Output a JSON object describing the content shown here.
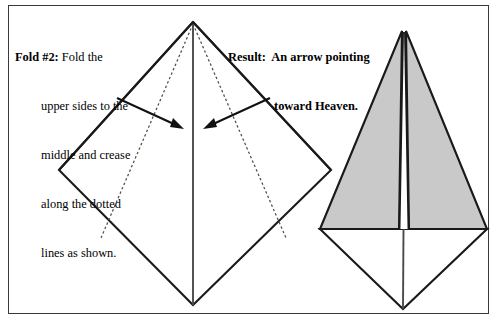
{
  "page": {
    "width": 497,
    "height": 321,
    "background": "#ffffff",
    "frame_color": "#3a3a3a"
  },
  "instruction": {
    "label": "Fold #2:",
    "line1": " Fold the",
    "line2": "upper sides to the",
    "line3": "middle and crease",
    "line4": "along the dotted",
    "line5": "lines as shown."
  },
  "result": {
    "label": "Result:",
    "line1": "  An arrow pointing",
    "line2": "toward Heaven."
  },
  "figures": {
    "left": {
      "name": "unfolded-square-diamond",
      "top": [
        193,
        22
      ],
      "left": [
        59,
        170
      ],
      "right": [
        331,
        170
      ],
      "bottom": [
        193,
        305
      ],
      "center_line_color": "#4a4a4a",
      "outline_color": "#1a1a1a",
      "crease_style": "dotted",
      "crease_color": "#555555"
    },
    "right": {
      "name": "folded-arrow-kite",
      "apex": [
        404,
        31
      ],
      "left_corner": [
        320,
        229
      ],
      "right_corner": [
        487,
        229
      ],
      "bottom": [
        403,
        309
      ],
      "fill_color": "#c9c9c9",
      "outline_color": "#1a1a1a",
      "center_gap_color": "#ffffff"
    }
  },
  "arrows": {
    "left_arrow": {
      "name": "fold-arrow-left",
      "tail": [
        117,
        98
      ],
      "head": [
        182,
        128
      ]
    },
    "right_arrow": {
      "name": "fold-arrow-right",
      "tail": [
        270,
        98
      ],
      "head": [
        205,
        128
      ]
    }
  }
}
